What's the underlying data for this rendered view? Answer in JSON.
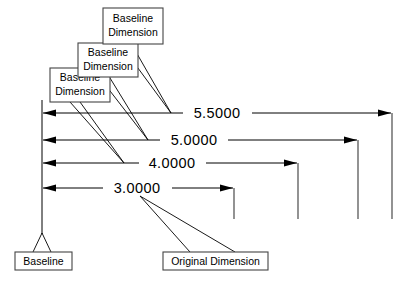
{
  "diagram": {
    "colors": {
      "line": "#000000",
      "extension_line": "#3a3a3a",
      "box_border": "#444444",
      "background": "#ffffff",
      "text": "#000000"
    },
    "dimensions": [
      {
        "id": "dim-5-5000",
        "value": "5.5000",
        "row": 1
      },
      {
        "id": "dim-5-0000",
        "value": "5.0000",
        "row": 2
      },
      {
        "id": "dim-4-0000",
        "value": "4.0000",
        "row": 3
      },
      {
        "id": "dim-3-0000",
        "value": "3.0000",
        "row": 4
      }
    ],
    "callouts": [
      {
        "id": "callout-baseline-dimension-1",
        "line1": "Baseline",
        "line2": "Dimension"
      },
      {
        "id": "callout-baseline-dimension-2",
        "line1": "Baseline",
        "line2": "Dimension"
      },
      {
        "id": "callout-baseline-dimension-3",
        "line1": "Baseline",
        "line2": "Dimension"
      }
    ],
    "annotations": [
      {
        "id": "label-baseline",
        "text": "Baseline"
      },
      {
        "id": "label-original-dimension",
        "text": "Original Dimension"
      }
    ]
  }
}
